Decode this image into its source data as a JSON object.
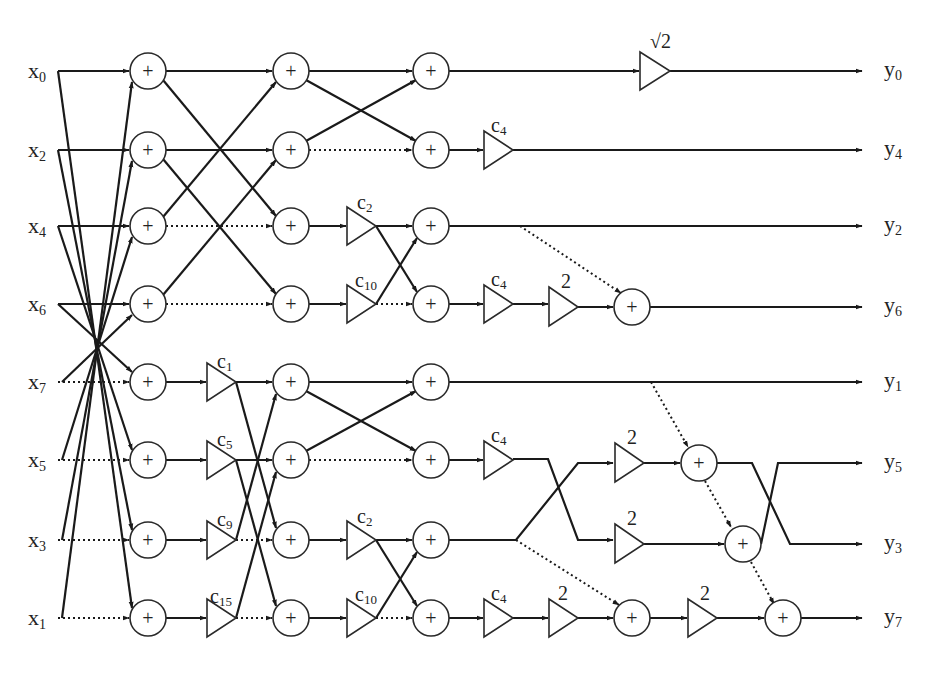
{
  "diagram": {
    "type": "signal-flow-graph",
    "rows_y": [
      71,
      150,
      226,
      304,
      382,
      460,
      540,
      618
    ],
    "inputs": [
      {
        "name": "x",
        "sub": "0"
      },
      {
        "name": "x",
        "sub": "2"
      },
      {
        "name": "x",
        "sub": "4"
      },
      {
        "name": "x",
        "sub": "6"
      },
      {
        "name": "x",
        "sub": "7"
      },
      {
        "name": "x",
        "sub": "5"
      },
      {
        "name": "x",
        "sub": "3"
      },
      {
        "name": "x",
        "sub": "1"
      }
    ],
    "outputs": [
      {
        "name": "y",
        "sub": "0"
      },
      {
        "name": "y",
        "sub": "4"
      },
      {
        "name": "y",
        "sub": "2"
      },
      {
        "name": "y",
        "sub": "6"
      },
      {
        "name": "y",
        "sub": "1"
      },
      {
        "name": "y",
        "sub": "5"
      },
      {
        "name": "y",
        "sub": "3"
      },
      {
        "name": "y",
        "sub": "7"
      }
    ],
    "adder_symbol": "+",
    "multipliers": {
      "sqrt2": {
        "label": "√2",
        "x": 640,
        "row": 0
      },
      "c4_row1": {
        "label": "c",
        "sub": "4",
        "x": 484,
        "row": 1
      },
      "c2_row2": {
        "label": "c",
        "sub": "2",
        "x": 347,
        "row": 2
      },
      "c10_row3": {
        "label": "c",
        "sub": "10",
        "x": 347,
        "row": 3
      },
      "c4_row3": {
        "label": "c",
        "sub": "4",
        "x": 484,
        "row": 3
      },
      "two_row3": {
        "label": "2",
        "x": 549,
        "row": 3
      },
      "c1_row4": {
        "label": "c",
        "sub": "1",
        "x": 207,
        "row": 4
      },
      "c5_row5": {
        "label": "c",
        "sub": "5",
        "x": 207,
        "row": 5
      },
      "c9_row6": {
        "label": "c",
        "sub": "9",
        "x": 207,
        "row": 6
      },
      "c15_row7": {
        "label": "c",
        "sub": "15",
        "x": 207,
        "row": 7
      },
      "c2_row6": {
        "label": "c",
        "sub": "2",
        "x": 347,
        "row": 6
      },
      "c10_row7": {
        "label": "c",
        "sub": "10",
        "x": 347,
        "row": 7
      },
      "c4_row5": {
        "label": "c",
        "sub": "4",
        "x": 484,
        "row": 5
      },
      "two_row5": {
        "label": "2",
        "x": 615,
        "row": 5
      },
      "two_row6": {
        "label": "2",
        "x": 615,
        "row": 6
      },
      "c4_row7": {
        "label": "c",
        "sub": "4",
        "x": 484,
        "row": 7
      },
      "two_row7a": {
        "label": "2",
        "x": 549,
        "row": 7
      },
      "two_row7b": {
        "label": "2",
        "x": 688,
        "row": 7
      }
    }
  }
}
